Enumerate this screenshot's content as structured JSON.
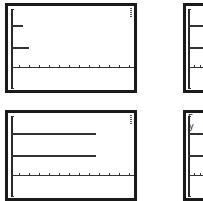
{
  "colors": {
    "frame": "#1a1a1a",
    "line": "#333333",
    "background": "#ffffff"
  },
  "panels": [
    {
      "id": "top-left",
      "level_lines": 2,
      "line_length": "short",
      "labels": []
    },
    {
      "id": "top-right",
      "level_lines": 2,
      "line_length": "long",
      "labels": []
    },
    {
      "id": "bottom-left",
      "level_lines": 2,
      "line_length": "long",
      "labels": []
    },
    {
      "id": "bottom-right",
      "level_lines": 2,
      "line_length": "long",
      "labels": [
        "Γ",
        "y"
      ]
    }
  ],
  "glyphs": {
    "gamma": "Γ",
    "y": "y"
  }
}
